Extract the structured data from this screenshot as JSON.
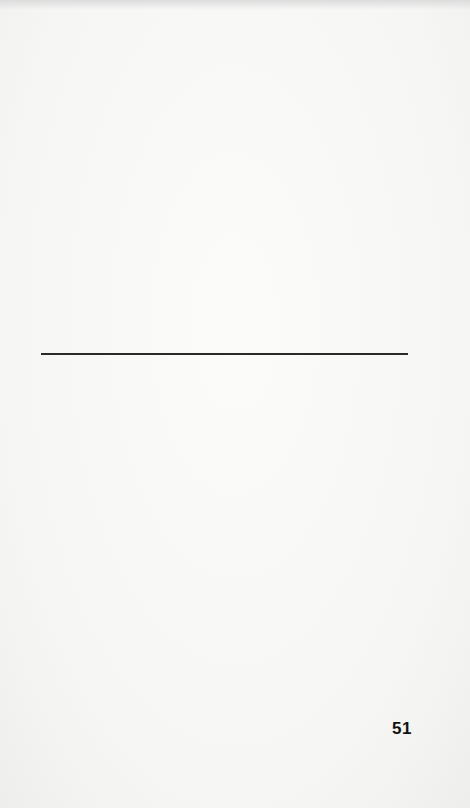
{
  "document": {
    "page_number": "51",
    "content": "Blank page with a single horizontal rule",
    "colors": {
      "paper": "#f7f7f6",
      "ink": "#111111"
    }
  }
}
